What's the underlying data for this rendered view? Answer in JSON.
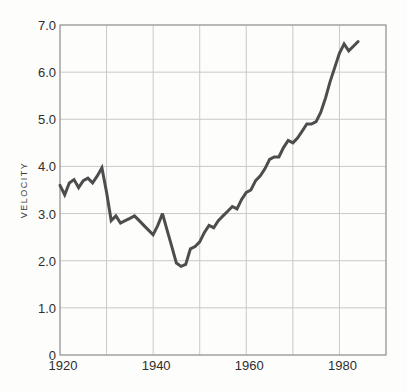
{
  "colors": {
    "background": "#fdfdfc",
    "line": "#4d4d4d",
    "grid": "#c9c9c9",
    "frame": "#9c9c9c",
    "text": "#2e2e2e"
  },
  "chart_data": {
    "type": "line",
    "title": "",
    "xlabel": "",
    "ylabel": "VELOCITY",
    "xlim": [
      1920,
      1990
    ],
    "ylim": [
      0,
      7
    ],
    "grid": true,
    "legend_position": "none",
    "x_gridline_step": 10,
    "y_gridline_step": 1,
    "x_tick_values": [
      1920,
      1940,
      1960,
      1980
    ],
    "x_ticks": [
      "1920",
      "1940",
      "1960",
      "1980"
    ],
    "y_tick_values": [
      7,
      6,
      5,
      4,
      3,
      2,
      1,
      0
    ],
    "y_ticks": [
      "7.0",
      "6.0",
      "5.0",
      "4.0",
      "3.0",
      "2.0",
      "1.0",
      "0"
    ],
    "series": [
      {
        "name": "velocity",
        "x": [
          1920,
          1921,
          1922,
          1923,
          1924,
          1925,
          1926,
          1927,
          1928,
          1929,
          1930,
          1931,
          1932,
          1933,
          1934,
          1935,
          1936,
          1937,
          1938,
          1939,
          1940,
          1941,
          1942,
          1943,
          1944,
          1945,
          1946,
          1947,
          1948,
          1949,
          1950,
          1951,
          1952,
          1953,
          1954,
          1955,
          1956,
          1957,
          1958,
          1959,
          1960,
          1961,
          1962,
          1963,
          1964,
          1965,
          1966,
          1967,
          1968,
          1969,
          1970,
          1971,
          1972,
          1973,
          1974,
          1975,
          1976,
          1977,
          1978,
          1979,
          1980,
          1981,
          1982,
          1983,
          1984
        ],
        "values": [
          3.6,
          3.4,
          3.65,
          3.72,
          3.55,
          3.7,
          3.75,
          3.65,
          3.8,
          3.97,
          3.45,
          2.85,
          2.95,
          2.8,
          2.85,
          2.9,
          2.95,
          2.85,
          2.75,
          2.65,
          2.55,
          2.75,
          3.0,
          2.65,
          2.3,
          1.95,
          1.88,
          1.92,
          2.25,
          2.3,
          2.4,
          2.6,
          2.75,
          2.7,
          2.85,
          2.95,
          3.05,
          3.15,
          3.1,
          3.3,
          3.45,
          3.5,
          3.7,
          3.8,
          3.95,
          4.15,
          4.2,
          4.2,
          4.4,
          4.55,
          4.5,
          4.6,
          4.75,
          4.9,
          4.9,
          4.95,
          5.15,
          5.45,
          5.8,
          6.1,
          6.4,
          6.6,
          6.45,
          6.55,
          6.65
        ]
      }
    ]
  }
}
